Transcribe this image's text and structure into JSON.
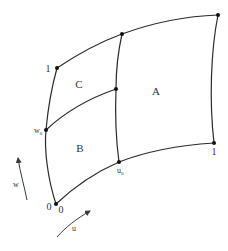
{
  "diagram": {
    "type": "parametric-surface-patch",
    "regions": [
      {
        "id": "A",
        "label": "A"
      },
      {
        "id": "B",
        "label": "B"
      },
      {
        "id": "C",
        "label": "C"
      }
    ],
    "corner_labels": {
      "origin_w": "0",
      "origin_u": "0",
      "w_max": "1",
      "u_max": "1",
      "w0": "w",
      "w0_sub": "0",
      "u0": "u",
      "u0_sub": "0"
    },
    "axes": {
      "w_label": "w",
      "u_label": "u"
    },
    "colors": {
      "stroke": "#2a2a2a",
      "points": "#111111",
      "text": "#333333"
    }
  }
}
